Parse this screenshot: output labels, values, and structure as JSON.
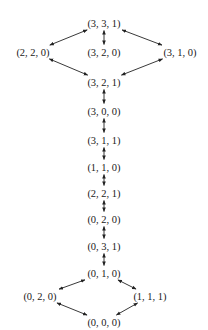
{
  "diagram": {
    "type": "state-transition-graph",
    "colors": {
      "background": "#ffffff",
      "ink": "#222222"
    },
    "nodes": [
      {
        "id": "n331",
        "label": "(3, 3, 1)",
        "x": 104,
        "y": 23
      },
      {
        "id": "n220",
        "label": "(2, 2, 0)",
        "x": 33,
        "y": 52
      },
      {
        "id": "n320",
        "label": "(3, 2, 0)",
        "x": 104,
        "y": 52
      },
      {
        "id": "n310",
        "label": "(3, 1, 0)",
        "x": 180,
        "y": 52
      },
      {
        "id": "n321",
        "label": "(3, 2, 1)",
        "x": 104,
        "y": 82
      },
      {
        "id": "n300",
        "label": "(3, 0, 0)",
        "x": 104,
        "y": 111
      },
      {
        "id": "n311",
        "label": "(3, 1, 1)",
        "x": 104,
        "y": 140
      },
      {
        "id": "n110",
        "label": "(1, 1, 0)",
        "x": 104,
        "y": 167
      },
      {
        "id": "n221",
        "label": "(2, 2, 1)",
        "x": 104,
        "y": 193
      },
      {
        "id": "n020a",
        "label": "(0, 2, 0)",
        "x": 104,
        "y": 219
      },
      {
        "id": "n031",
        "label": "(0, 3, 1)",
        "x": 104,
        "y": 246
      },
      {
        "id": "n010",
        "label": "(0, 1, 0)",
        "x": 104,
        "y": 273
      },
      {
        "id": "n020b",
        "label": "(0, 2, 0)",
        "x": 40,
        "y": 296
      },
      {
        "id": "n111",
        "label": "(1, 1, 1)",
        "x": 150,
        "y": 296
      },
      {
        "id": "n000",
        "label": "(0, 0, 0)",
        "x": 104,
        "y": 322
      }
    ],
    "edges": [
      {
        "from": "n331",
        "to": "n220",
        "bidirectional": true
      },
      {
        "from": "n331",
        "to": "n320",
        "bidirectional": true
      },
      {
        "from": "n331",
        "to": "n310",
        "bidirectional": true
      },
      {
        "from": "n220",
        "to": "n321",
        "bidirectional": true
      },
      {
        "from": "n310",
        "to": "n321",
        "bidirectional": true
      },
      {
        "from": "n321",
        "to": "n300",
        "bidirectional": true
      },
      {
        "from": "n300",
        "to": "n311",
        "bidirectional": true
      },
      {
        "from": "n311",
        "to": "n110",
        "bidirectional": true
      },
      {
        "from": "n110",
        "to": "n221",
        "bidirectional": true
      },
      {
        "from": "n221",
        "to": "n020a",
        "bidirectional": true
      },
      {
        "from": "n020a",
        "to": "n031",
        "bidirectional": true
      },
      {
        "from": "n031",
        "to": "n010",
        "bidirectional": true
      },
      {
        "from": "n010",
        "to": "n020b",
        "bidirectional": true
      },
      {
        "from": "n010",
        "to": "n111",
        "bidirectional": true
      },
      {
        "from": "n020b",
        "to": "n000",
        "bidirectional": true
      },
      {
        "from": "n111",
        "to": "n000",
        "bidirectional": true
      }
    ]
  }
}
